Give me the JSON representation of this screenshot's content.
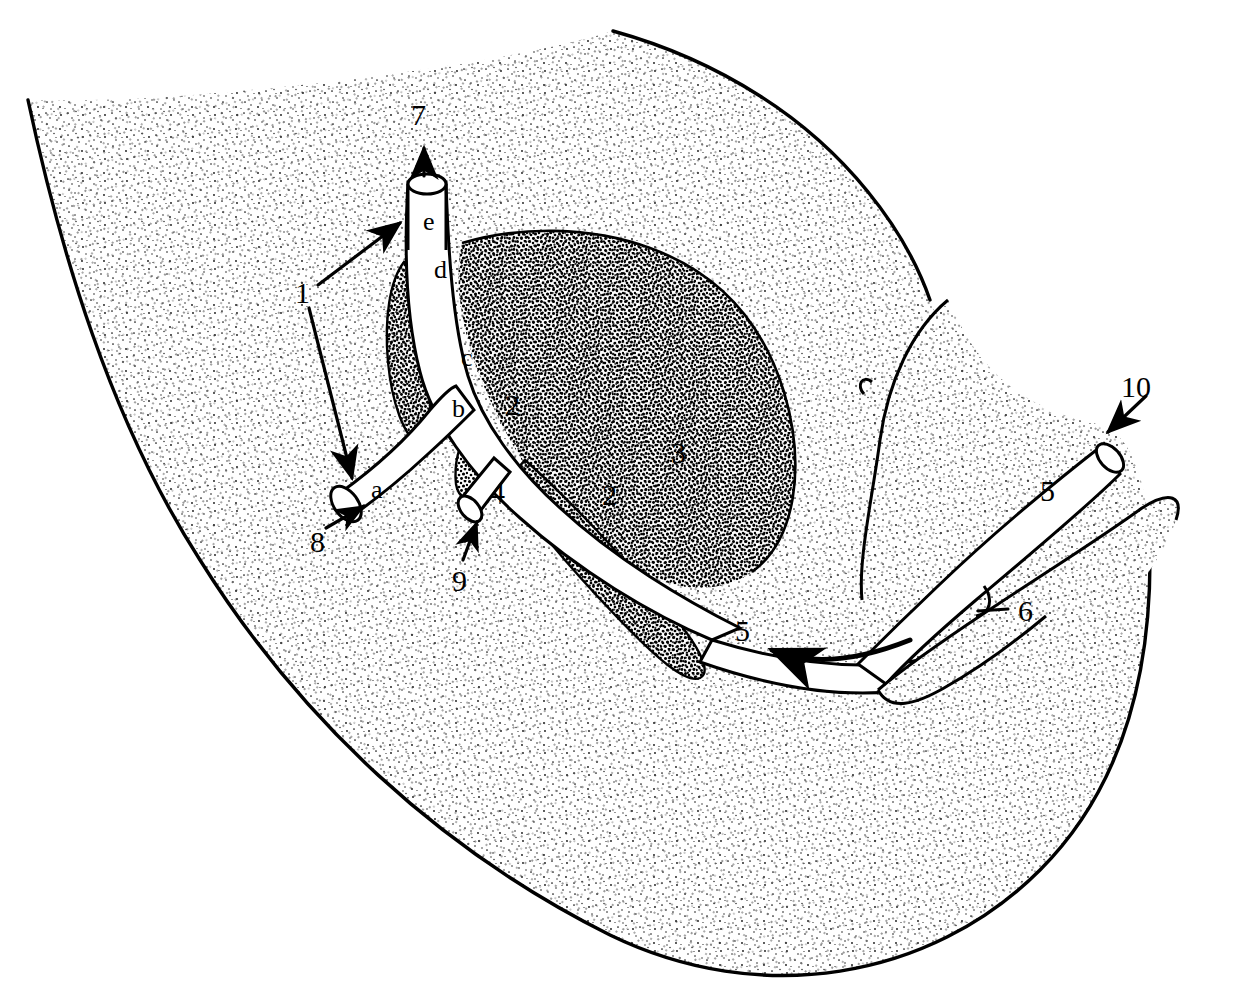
{
  "figure": {
    "style": "black-and-white stipple line art",
    "ink_color": "#000000",
    "background_color": "#ffffff",
    "stipple_light_color": "#1a1a1a",
    "stipple_dark_color": "#000000",
    "canvas": {
      "width": 1238,
      "height": 1001
    }
  },
  "labels": [
    {
      "id": "label-1",
      "text": "1",
      "x": 295,
      "y": 278,
      "kind": "number",
      "leader": "double-arrow-bracket"
    },
    {
      "id": "label-7",
      "text": "7",
      "x": 411,
      "y": 100,
      "kind": "number",
      "leader": "arrow-up"
    },
    {
      "id": "label-e",
      "text": "e",
      "x": 423,
      "y": 209,
      "kind": "letter",
      "leader": "none"
    },
    {
      "id": "label-d",
      "text": "d",
      "x": 434,
      "y": 257,
      "kind": "letter",
      "leader": "none"
    },
    {
      "id": "label-c",
      "text": "c",
      "x": 461,
      "y": 345,
      "kind": "letter",
      "leader": "none"
    },
    {
      "id": "label-b",
      "text": "b",
      "x": 452,
      "y": 396,
      "kind": "letter",
      "leader": "none"
    },
    {
      "id": "label-a",
      "text": "a",
      "x": 371,
      "y": 477,
      "kind": "letter",
      "leader": "none"
    },
    {
      "id": "label-2a",
      "text": "2",
      "x": 505,
      "y": 390,
      "kind": "number",
      "leader": "none"
    },
    {
      "id": "label-2b",
      "text": "2",
      "x": 602,
      "y": 480,
      "kind": "number",
      "leader": "none"
    },
    {
      "id": "label-3",
      "text": "3",
      "x": 671,
      "y": 438,
      "kind": "number",
      "leader": "none"
    },
    {
      "id": "label-4",
      "text": "4",
      "x": 490,
      "y": 477,
      "kind": "number",
      "leader": "none"
    },
    {
      "id": "label-8",
      "text": "8",
      "x": 310,
      "y": 527,
      "kind": "number",
      "leader": "arrow-up-right"
    },
    {
      "id": "label-9",
      "text": "9",
      "x": 452,
      "y": 566,
      "kind": "number",
      "leader": "arrow-up-right"
    },
    {
      "id": "label-5a",
      "text": "5",
      "x": 1040,
      "y": 476,
      "kind": "number",
      "leader": "none"
    },
    {
      "id": "label-5b",
      "text": "5",
      "x": 735,
      "y": 616,
      "kind": "number",
      "leader": "curved-arrow-left"
    },
    {
      "id": "label-6",
      "text": "6",
      "x": 1018,
      "y": 596,
      "kind": "number",
      "leader": "short-line"
    },
    {
      "id": "label-10",
      "text": "10",
      "x": 1121,
      "y": 372,
      "kind": "number",
      "leader": "arrow-down-left"
    }
  ],
  "regions": [
    {
      "name": "outer-tissue-mass",
      "fill": "light-stipple",
      "description": "large crescent-shaped body occupying most of frame"
    },
    {
      "name": "central-dense-mass",
      "fill": "dense-stipple",
      "description": "ovoid dark stippled organ in the middle of the field, labelled 3"
    },
    {
      "name": "left-dense-wedge",
      "fill": "dense-stipple",
      "description": "narrow dark wedge beside the vertical duct"
    },
    {
      "name": "lower-dense-band",
      "fill": "dense-stipple",
      "description": "dark band below the branch labelled 4"
    },
    {
      "name": "right-tissue-flap",
      "fill": "light-stipple",
      "description": "upper right flap of tissue behind duct 5"
    },
    {
      "name": "duct-tree",
      "fill": "white",
      "description": "white branched tubular duct system with segments a, b, c, d, e"
    },
    {
      "name": "right-duct",
      "fill": "white",
      "description": "white tubular duct running to the lower right, cut end at 10"
    }
  ]
}
